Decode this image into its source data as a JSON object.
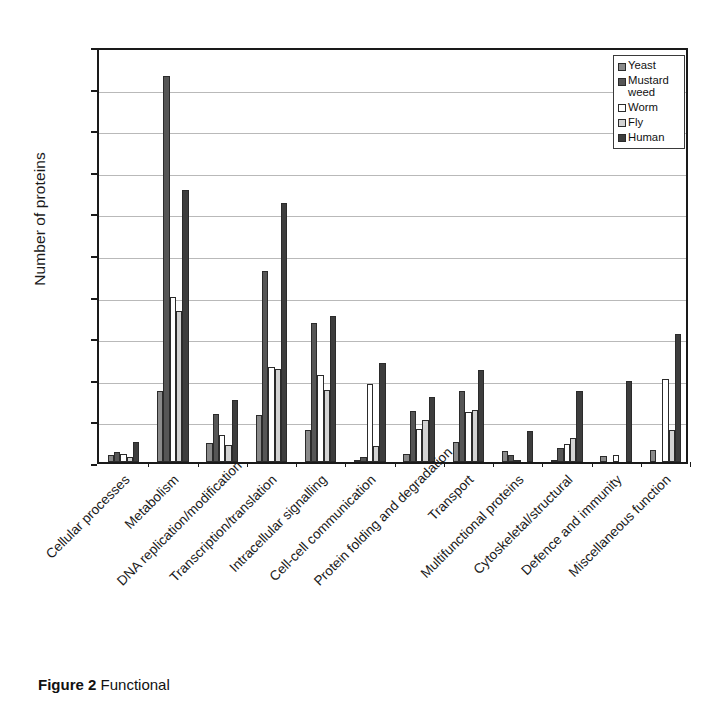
{
  "figure": {
    "caption_label": "Figure 2",
    "caption_text": "Functional"
  },
  "chart_data": {
    "type": "bar",
    "title": "",
    "xlabel": "",
    "ylabel": "Number of proteins",
    "ylim": [
      0,
      5000
    ],
    "ytick_values": [
      0,
      500,
      1000,
      1500,
      2000,
      2500,
      3000,
      3500,
      4000,
      4500,
      5000
    ],
    "ytick_labels": [
      "0",
      "500",
      "1,000",
      "1,500",
      "2,000",
      "2,500",
      "3,000",
      "3,500",
      "4,000",
      "4,500",
      "5,000"
    ],
    "grid": true,
    "legend_position": "top-right",
    "categories": [
      "Cellular processes",
      "Metabolism",
      "DNA replication/modification",
      "Transcription/translation",
      "Intracellular signalling",
      "Cell-cell communication",
      "Protein folding and degradation",
      "Transport",
      "Multifunctional proteins",
      "Cytoskeletal/structural",
      "Defence and immunity",
      "Miscellaneous function"
    ],
    "series": [
      {
        "name": "Yeast",
        "color": "#8a8a8a",
        "values": [
          80,
          850,
          230,
          570,
          390,
          30,
          100,
          240,
          130,
          25,
          75,
          150
        ]
      },
      {
        "name": "Mustard weed",
        "color": "#565656",
        "values": [
          125,
          4640,
          580,
          2300,
          1670,
          60,
          610,
          850,
          85,
          170,
          0,
          0
        ]
      },
      {
        "name": "Worm",
        "color": "#ffffff",
        "values": [
          95,
          1980,
          320,
          1140,
          1050,
          940,
          400,
          600,
          25,
          220,
          90,
          1000
        ]
      },
      {
        "name": "Fly",
        "color": "#d3d3d3",
        "values": [
          60,
          1810,
          210,
          1120,
          860,
          190,
          510,
          630,
          0,
          290,
          0,
          380
        ]
      },
      {
        "name": "Human",
        "color": "#3d3d3d",
        "values": [
          235,
          3270,
          750,
          3110,
          1760,
          1195,
          780,
          1100,
          370,
          850,
          970,
          1540
        ]
      }
    ]
  }
}
